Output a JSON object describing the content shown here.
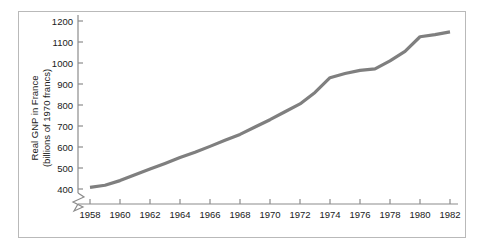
{
  "figure": {
    "frame_color": "#b9b9b9",
    "background": "#ffffff"
  },
  "chart_data": {
    "type": "line",
    "title": "",
    "subtitle": "",
    "xlabel": "",
    "ylabel": "Real GNP in France\n(billions of 1970 francs)",
    "ylabel_line1": "Real GNP in France",
    "ylabel_line2": "(billions of 1970 francs)",
    "series_color": "#7f7f7f",
    "grid": false,
    "legend": "none",
    "axis_break_y": true,
    "axis_break_note": "zigzag break on y-axis below 400",
    "xlim": [
      1957.4,
      1982.4
    ],
    "ylim": [
      390,
      1215
    ],
    "xticks": [
      1958,
      1960,
      1962,
      1964,
      1966,
      1968,
      1970,
      1972,
      1974,
      1976,
      1978,
      1980,
      1982
    ],
    "xtick_labels": [
      "1958",
      "1960",
      "1962",
      "1964",
      "1966",
      "1968",
      "1970",
      "1972",
      "1974",
      "1976",
      "1978",
      "1980",
      "1982"
    ],
    "yticks": [
      400,
      500,
      600,
      700,
      800,
      900,
      1000,
      1100,
      1200
    ],
    "ytick_labels": [
      "400",
      "500",
      "600",
      "700",
      "800",
      "900",
      "1000",
      "1100",
      "1200"
    ],
    "x": [
      1958,
      1959,
      1960,
      1961,
      1962,
      1963,
      1964,
      1965,
      1966,
      1967,
      1968,
      1969,
      1970,
      1971,
      1972,
      1973,
      1974,
      1975,
      1976,
      1977,
      1978,
      1979,
      1980,
      1981,
      1982
    ],
    "values": [
      408,
      418,
      440,
      468,
      495,
      522,
      550,
      575,
      603,
      632,
      660,
      695,
      730,
      768,
      805,
      860,
      930,
      950,
      965,
      972,
      1010,
      1055,
      1125,
      1135,
      1148
    ],
    "series": [
      {
        "name": "Real GNP in France",
        "values": [
          408,
          418,
          440,
          468,
          495,
          522,
          550,
          575,
          603,
          632,
          660,
          695,
          730,
          768,
          805,
          860,
          930,
          950,
          965,
          972,
          1010,
          1055,
          1125,
          1135,
          1148
        ]
      }
    ]
  }
}
